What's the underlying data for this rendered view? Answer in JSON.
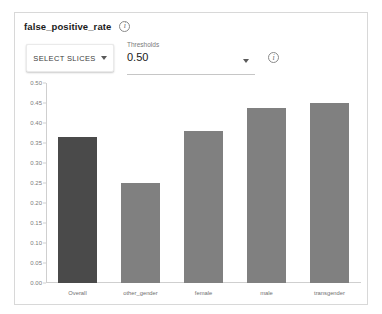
{
  "header": {
    "metric_title": "false_positive_rate",
    "info_icon": "info-icon",
    "info_glyph": "i"
  },
  "controls": {
    "select_slices_label": "SELECT SLICES",
    "select_slices_caret": "chevron-down-icon",
    "threshold_label": "Thresholds",
    "threshold_value": "0.50",
    "threshold_caret": "chevron-down-icon",
    "threshold_info_icon": "info-icon",
    "threshold_info_glyph": "i"
  },
  "chart_data": {
    "type": "bar",
    "title": "false_positive_rate",
    "xlabel": "",
    "ylabel": "",
    "categories": [
      "Overall",
      "other_gender",
      "female",
      "male",
      "transgender"
    ],
    "values": [
      0.366,
      0.251,
      0.38,
      0.438,
      0.45
    ],
    "ylim": [
      0.0,
      0.5
    ],
    "yticks": [
      "0.50",
      "0.45",
      "0.40",
      "0.35",
      "0.30",
      "0.25",
      "0.20",
      "0.15",
      "0.10",
      "0.05",
      "0.00"
    ],
    "ytick_values": [
      0.5,
      0.45,
      0.4,
      0.35,
      0.3,
      0.25,
      0.2,
      0.15,
      0.1,
      0.05,
      0.0
    ],
    "grid": false,
    "legend": "none",
    "bar_color": "#808080",
    "highlight_color": "#4a4a4a",
    "highlight_index": 0
  }
}
